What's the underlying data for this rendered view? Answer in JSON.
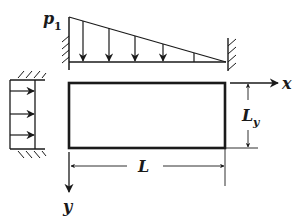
{
  "diagram": {
    "labels": {
      "load_magnitude": "p",
      "load_subscript": "1",
      "x_axis": "x",
      "y_axis": "y",
      "length": "L",
      "height_main": "L",
      "height_sub": "y"
    },
    "colors": {
      "stroke": "#1a1a1a",
      "background": "#ffffff"
    },
    "elements": {
      "top_load": {
        "type": "triangular distributed load",
        "arrows": 4,
        "direction": "down"
      },
      "side_load": {
        "type": "uniform distributed load",
        "arrows": 3,
        "direction": "right"
      },
      "plate": {
        "type": "rectangle"
      },
      "supports": [
        "left wall (top load)",
        "right wall (top load)",
        "top wall (side load)",
        "bottom wall (side load)"
      ]
    }
  }
}
